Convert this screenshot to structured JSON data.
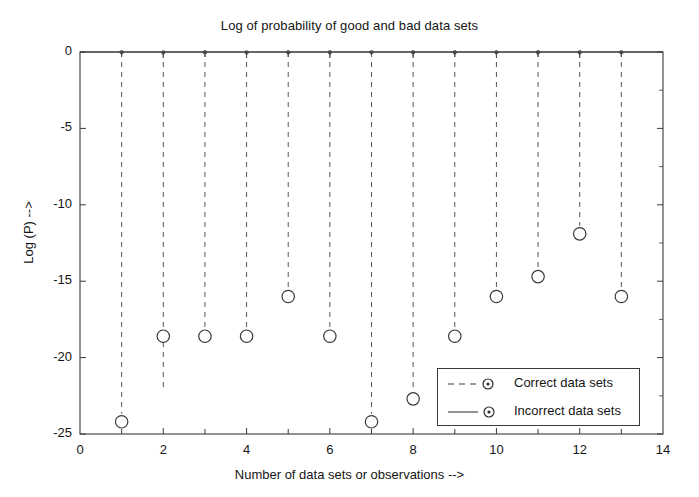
{
  "chart_data": {
    "type": "scatter",
    "title": "Log of probability of good and bad data sets",
    "xlabel": "Number of data sets or observations -->",
    "ylabel": "Log (P) -->",
    "xlim": [
      0,
      14
    ],
    "ylim": [
      -25,
      0
    ],
    "xticks": [
      0,
      2,
      4,
      6,
      8,
      10,
      12,
      14
    ],
    "xticklabels": [
      "0",
      "2",
      "4",
      "6",
      "8",
      "10",
      "12",
      "14"
    ],
    "yticks": [
      0,
      -5,
      -10,
      -15,
      -20,
      -25
    ],
    "yticklabels": [
      "0",
      "-5",
      "-10",
      "-15",
      "-20",
      "-25"
    ],
    "x_minor_ticks": [
      1,
      3,
      5,
      7,
      9,
      11,
      13
    ],
    "grid": false,
    "legend_position": "lower right",
    "plot_style": "stem",
    "x": [
      1,
      2,
      3,
      4,
      5,
      6,
      7,
      8,
      9,
      10,
      11,
      12,
      13
    ],
    "series": [
      {
        "name": "Correct data sets",
        "line_style": "dashed",
        "marker": "circle-dot",
        "values": [
          -0.02,
          -0.03,
          -0.02,
          -0.03,
          -0.02,
          -0.02,
          -0.02,
          -0.02,
          -0.02,
          -0.02,
          -0.02,
          -0.02,
          -0.02
        ]
      },
      {
        "name": "Incorrect data sets",
        "line_style": "solid",
        "marker": "circle-dot",
        "values": [
          -24.2,
          -18.6,
          -18.6,
          -18.6,
          -16.0,
          -18.6,
          -24.2,
          -22.7,
          -18.6,
          -16.0,
          -14.7,
          -11.9,
          -16.0
        ]
      }
    ],
    "stem_values": [
      -24.2,
      -22.7,
      -18.6,
      -18.6,
      -16.0,
      -18.6,
      -24.2,
      -22.7,
      -18.6,
      -16.0,
      -14.7,
      -11.9,
      -16.0
    ],
    "colors": {
      "axis": "#3a3a3a",
      "stem": "#555555",
      "marker": "#3a3a3a",
      "background": "#ffffff",
      "text": "#151515"
    }
  },
  "legend": {
    "entries": [
      {
        "label": "Correct data sets"
      },
      {
        "label": "Incorrect data sets"
      }
    ]
  }
}
